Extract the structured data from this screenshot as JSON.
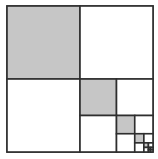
{
  "diagram": {
    "type": "recursive-square-subdivision",
    "outer_square": {
      "x": 7,
      "y": 6,
      "size": 146
    },
    "levels": 6,
    "ratio": 0.5,
    "shaded_quadrant": "top-left",
    "recursive_quadrant": "bottom-right",
    "colors": {
      "background": "#ffffff",
      "shade": "#c6c6c6",
      "stroke": "#2e2e2e"
    },
    "stroke_width": 1.6
  }
}
